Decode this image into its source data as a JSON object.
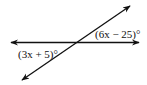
{
  "diagram": {
    "type": "intersecting-lines",
    "lines": [
      {
        "name": "horizontal-line",
        "from": [
          10,
          42
        ],
        "to": [
          140,
          42
        ],
        "arrows": "both"
      },
      {
        "name": "transversal-line",
        "from": [
          22,
          80
        ],
        "to": [
          130,
          5
        ],
        "arrows": "both"
      }
    ],
    "angles": [
      {
        "label": "(6x − 25)°",
        "position": "upper-right"
      },
      {
        "label": "(3x + 5)°",
        "position": "lower-left"
      }
    ],
    "colors": {
      "stroke": "#111111",
      "background": "#ffffff"
    }
  }
}
